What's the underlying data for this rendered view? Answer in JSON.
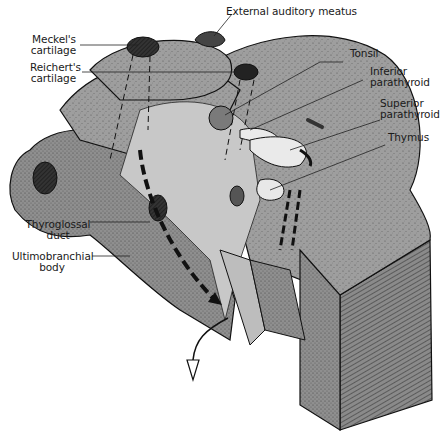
{
  "figure": {
    "colors": {
      "tissue": "#9a9a9a",
      "tissue_light": "#b8b8b8",
      "cut_face": "#7d7d7d",
      "pale_organ": "#e6e6e6",
      "cartilage": "#2a2a2a",
      "outline": "#111111",
      "background": "#ffffff"
    }
  },
  "labels": {
    "external_auditory_meatus": "External auditory meatus",
    "meckels_line1": "Meckel's",
    "meckels_line2": "cartilage",
    "reicherts_line1": "Reichert's",
    "reicherts_line2": "cartilage",
    "tonsil": "Tonsil",
    "inferior_line1": "Inferior",
    "inferior_line2": "parathyroid",
    "superior_line1": "Superior",
    "superior_line2": "parathyroid",
    "thymus": "Thymus",
    "thyroglossal_line1": "Thyroglossal",
    "thyroglossal_line2": "duct",
    "ultimo_line1": "Ultimobranchial",
    "ultimo_line2": "body"
  }
}
